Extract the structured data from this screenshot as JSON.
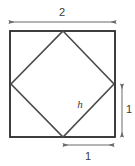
{
  "figure": {
    "background_color": "#ffffff",
    "canvas": {
      "width": 135,
      "height": 166
    },
    "colors": {
      "outer_square_stroke": "#2a2a2a",
      "inner_square_stroke": "#4a4a4a",
      "dimension_line": "#6a6a6a",
      "label_text": "#3a3a3a"
    },
    "outer_square": {
      "name": "outer-square",
      "x": 10,
      "y": 31,
      "width": 105,
      "height": 106,
      "stroke_width": 1.8,
      "side_label_top": "2",
      "fill": "none"
    },
    "inner_square": {
      "name": "inner-tilted-square",
      "points": "63,31 114,84 63,137 11,84",
      "stroke_width": 1.6,
      "fill": "none",
      "description": "vertices at midpoints of outer square sides"
    },
    "hypotenuse_label": {
      "text": "h",
      "x": 80,
      "y": 105,
      "style": "italic"
    },
    "dimensions": [
      {
        "name": "top-dimension-2",
        "label": "2",
        "orientation": "horizontal",
        "x1": 9,
        "y1": 22,
        "x2": 116,
        "y2": 22,
        "label_x": 62,
        "label_y": 13,
        "arrows": "both"
      },
      {
        "name": "right-dimension-1",
        "label": "1",
        "orientation": "vertical",
        "x1": 122,
        "y1": 84,
        "x2": 122,
        "y2": 137,
        "label_x": 129,
        "label_y": 110,
        "arrows": "both"
      },
      {
        "name": "bottom-dimension-1",
        "label": "1",
        "orientation": "horizontal",
        "x1": 63,
        "y1": 145,
        "x2": 114,
        "y2": 145,
        "label_x": 88,
        "label_y": 157,
        "arrows": "both"
      }
    ]
  }
}
